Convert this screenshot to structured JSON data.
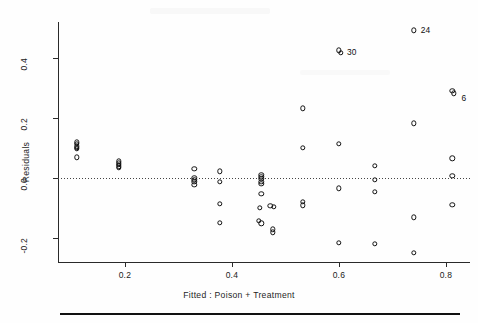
{
  "chart_data": {
    "type": "scatter",
    "title": "",
    "xlabel": "Fitted : Poison + Treatment",
    "ylabel": "Residuals",
    "xlim": [
      0.075,
      0.845
    ],
    "ylim": [
      -0.28,
      0.52
    ],
    "xticks": [
      0.2,
      0.4,
      0.6,
      0.8
    ],
    "xticklabels": [
      "0.2",
      "0.4",
      "0.6",
      "0.8"
    ],
    "yticks": [
      -0.2,
      0.0,
      0.2,
      0.4
    ],
    "yticklabels": [
      "-0.2",
      "0.0",
      "0.2",
      "0.4"
    ],
    "grid": false,
    "legend": null,
    "reference_line": {
      "y": 0.0,
      "style": "dotted"
    },
    "marker": "open-circle",
    "points": [
      {
        "x": 0.11,
        "y": 0.118
      },
      {
        "x": 0.11,
        "y": 0.112
      },
      {
        "x": 0.11,
        "y": 0.105
      },
      {
        "x": 0.11,
        "y": 0.1
      },
      {
        "x": 0.11,
        "y": 0.096
      },
      {
        "x": 0.11,
        "y": 0.068
      },
      {
        "x": 0.188,
        "y": 0.055
      },
      {
        "x": 0.188,
        "y": 0.048
      },
      {
        "x": 0.188,
        "y": 0.043
      },
      {
        "x": 0.188,
        "y": 0.038
      },
      {
        "x": 0.188,
        "y": 0.032
      },
      {
        "x": 0.33,
        "y": 0.029
      },
      {
        "x": 0.33,
        "y": 0.0
      },
      {
        "x": 0.33,
        "y": -0.007
      },
      {
        "x": 0.33,
        "y": -0.014
      },
      {
        "x": 0.33,
        "y": -0.024
      },
      {
        "x": 0.378,
        "y": 0.021
      },
      {
        "x": 0.378,
        "y": -0.013
      },
      {
        "x": 0.378,
        "y": -0.087
      },
      {
        "x": 0.378,
        "y": -0.15
      },
      {
        "x": 0.455,
        "y": 0.009
      },
      {
        "x": 0.455,
        "y": 0.002
      },
      {
        "x": 0.455,
        "y": -0.004
      },
      {
        "x": 0.455,
        "y": -0.013
      },
      {
        "x": 0.455,
        "y": -0.02
      },
      {
        "x": 0.455,
        "y": -0.055
      },
      {
        "x": 0.452,
        "y": -0.1
      },
      {
        "x": 0.45,
        "y": -0.145
      },
      {
        "x": 0.455,
        "y": -0.152
      },
      {
        "x": 0.472,
        "y": -0.095
      },
      {
        "x": 0.478,
        "y": -0.098
      },
      {
        "x": 0.476,
        "y": -0.172
      },
      {
        "x": 0.476,
        "y": -0.182
      },
      {
        "x": 0.533,
        "y": 0.232
      },
      {
        "x": 0.533,
        "y": 0.1
      },
      {
        "x": 0.533,
        "y": -0.08
      },
      {
        "x": 0.533,
        "y": -0.092
      },
      {
        "x": 0.6,
        "y": 0.425
      },
      {
        "x": 0.604,
        "y": 0.418
      },
      {
        "x": 0.6,
        "y": 0.112
      },
      {
        "x": 0.6,
        "y": -0.035
      },
      {
        "x": 0.6,
        "y": -0.218
      },
      {
        "x": 0.667,
        "y": 0.039
      },
      {
        "x": 0.667,
        "y": -0.008
      },
      {
        "x": 0.667,
        "y": -0.047
      },
      {
        "x": 0.667,
        "y": -0.222
      },
      {
        "x": 0.74,
        "y": 0.492
      },
      {
        "x": 0.74,
        "y": 0.182
      },
      {
        "x": 0.74,
        "y": -0.132
      },
      {
        "x": 0.74,
        "y": -0.252
      },
      {
        "x": 0.812,
        "y": 0.29
      },
      {
        "x": 0.815,
        "y": 0.282
      },
      {
        "x": 0.812,
        "y": 0.065
      },
      {
        "x": 0.812,
        "y": 0.007
      },
      {
        "x": 0.812,
        "y": -0.09
      }
    ],
    "annotations": [
      {
        "text": "24",
        "x": 0.74,
        "y": 0.492,
        "dx": 7,
        "dy": 0
      },
      {
        "text": "30",
        "x": 0.604,
        "y": 0.42,
        "dx": 6,
        "dy": 0
      },
      {
        "text": "6",
        "x": 0.818,
        "y": 0.277,
        "dx": 6,
        "dy": 3
      }
    ]
  }
}
